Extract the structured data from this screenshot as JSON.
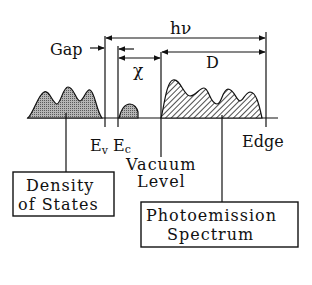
{
  "diagram": {
    "type": "photoemission energy diagram",
    "labels": {
      "gap": "Gap",
      "hv": "hν",
      "chi": "χ",
      "d": "D",
      "ev_main": "E",
      "ev_sub": "v",
      "ec_main": "E",
      "ec_sub": "c",
      "vacuum_line1": "Vacuum",
      "vacuum_line2": "Level",
      "edge": "Edge"
    },
    "boxes": {
      "dos_line1": "Density",
      "dos_line2": "of States",
      "pes_line1": "Photoemission",
      "pes_line2": "Spectrum"
    },
    "colors": {
      "ink": "#111111",
      "dos_fill": "#9a9a9a",
      "background": "#ffffff"
    }
  }
}
